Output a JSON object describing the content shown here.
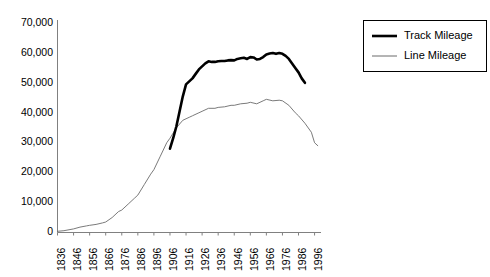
{
  "chart_data": {
    "type": "line",
    "title": "",
    "xlabel": "",
    "ylabel": "",
    "grid": false,
    "legend_position": "top-right",
    "xlim": [
      1836,
      2000
    ],
    "ylim": [
      0,
      70000
    ],
    "ytick_labels": [
      "70,000",
      "60,000",
      "50,000",
      "40,000",
      "30,000",
      "20,000",
      "10,000",
      "0"
    ],
    "ytick_values": [
      70000,
      60000,
      50000,
      40000,
      30000,
      20000,
      10000,
      0
    ],
    "xtick_labels": [
      "1836",
      "1846",
      "1856",
      "1866",
      "1876",
      "1886",
      "1896",
      "1906",
      "1916",
      "1926",
      "1936",
      "1946",
      "1956",
      "1966",
      "1976",
      "1986",
      "1996"
    ],
    "xtick_values": [
      1836,
      1846,
      1856,
      1866,
      1876,
      1886,
      1896,
      1906,
      1916,
      1926,
      1936,
      1946,
      1956,
      1966,
      1976,
      1986,
      1996
    ],
    "series": [
      {
        "name": "Track Mileage",
        "color": "#000000",
        "style": "thick",
        "x": [
          1906,
          1908,
          1910,
          1912,
          1914,
          1916,
          1918,
          1920,
          1922,
          1924,
          1926,
          1928,
          1930,
          1932,
          1934,
          1936,
          1938,
          1940,
          1942,
          1944,
          1946,
          1948,
          1950,
          1952,
          1954,
          1956,
          1958,
          1960,
          1962,
          1964,
          1966,
          1968,
          1970,
          1972,
          1974,
          1976,
          1978,
          1980,
          1982,
          1984,
          1986,
          1988,
          1990
        ],
        "values": [
          28000,
          31500,
          35500,
          40500,
          45500,
          49500,
          50500,
          51500,
          53000,
          54500,
          55500,
          56500,
          57200,
          57000,
          57000,
          57200,
          57300,
          57300,
          57500,
          57600,
          57500,
          58000,
          58200,
          58400,
          58000,
          58600,
          58500,
          57800,
          58000,
          58600,
          59500,
          59800,
          60000,
          59700,
          60000,
          59700,
          59000,
          58000,
          56500,
          55000,
          53500,
          51500,
          50000
        ]
      },
      {
        "name": "Line Mileage",
        "color": "#6b6b6b",
        "style": "thin",
        "x": [
          1836,
          1840,
          1846,
          1850,
          1854,
          1856,
          1860,
          1864,
          1866,
          1870,
          1874,
          1876,
          1880,
          1884,
          1886,
          1890,
          1894,
          1896,
          1900,
          1904,
          1906,
          1910,
          1914,
          1916,
          1918,
          1920,
          1924,
          1926,
          1930,
          1934,
          1936,
          1940,
          1944,
          1946,
          1950,
          1954,
          1956,
          1960,
          1964,
          1966,
          1970,
          1974,
          1976,
          1980,
          1984,
          1986,
          1990,
          1994,
          1996,
          1998
        ],
        "values": [
          400,
          600,
          1200,
          1800,
          2200,
          2400,
          2700,
          3200,
          3500,
          5000,
          7000,
          7500,
          9500,
          11500,
          12500,
          16000,
          19500,
          21000,
          25500,
          30000,
          31500,
          35000,
          37500,
          38000,
          38500,
          39000,
          40000,
          40500,
          41500,
          41500,
          41800,
          42000,
          42500,
          42500,
          43000,
          43200,
          43500,
          43000,
          44000,
          44500,
          44000,
          44200,
          44000,
          42500,
          40000,
          39000,
          36500,
          33500,
          30000,
          29000
        ]
      }
    ]
  },
  "legend": {
    "items": [
      {
        "label": "Track Mileage"
      },
      {
        "label": "Line Mileage"
      }
    ]
  }
}
